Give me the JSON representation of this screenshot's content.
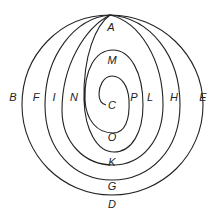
{
  "diagram": {
    "line_color": "#222222",
    "background": "#ffffff",
    "regions": {
      "A": "A",
      "B": "B",
      "C": "C",
      "D": "D",
      "E": "E",
      "F": "F",
      "G": "G",
      "H": "H",
      "I": "I",
      "K": "K",
      "L": "L",
      "M": "M",
      "N": "N",
      "O": "O",
      "P": "P"
    }
  }
}
